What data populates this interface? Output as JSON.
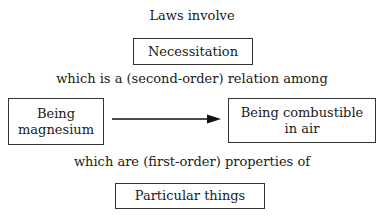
{
  "diagram": {
    "heading": "Laws involve",
    "top_box": "Necessitation",
    "relation_text": "which is a (second-order) relation among",
    "left_box": {
      "line1": "Being",
      "line2": "magnesium"
    },
    "right_box": {
      "line1": "Being combustible",
      "line2": "in air"
    },
    "property_text": "which are (first-order) properties of",
    "bottom_box": "Particular things",
    "arrow": {
      "from": "left_box",
      "to": "right_box",
      "color": "#111111"
    }
  }
}
